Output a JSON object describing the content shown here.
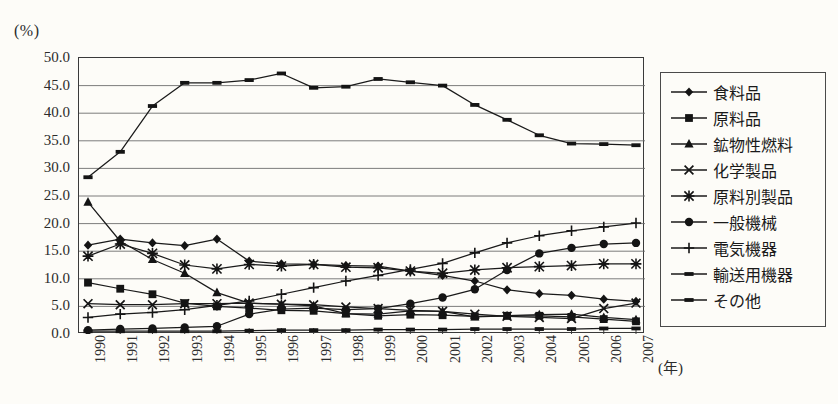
{
  "chart_data": {
    "type": "line",
    "title": "",
    "xlabel": "(年)",
    "ylabel": "(%)",
    "unit_label": "(%)",
    "x_unit_label": "(年)",
    "grid": true,
    "legend_position": "right",
    "ylim": [
      0.0,
      50.0
    ],
    "ytick_step": 5.0,
    "yticks": [
      "0.0",
      "5.0",
      "10.0",
      "15.0",
      "20.0",
      "25.0",
      "30.0",
      "35.0",
      "40.0",
      "45.0",
      "50.0"
    ],
    "categories": [
      "1990",
      "1991",
      "1992",
      "1993",
      "1994",
      "1995",
      "1996",
      "1997",
      "1998",
      "1999",
      "2000",
      "2001",
      "2002",
      "2003",
      "2004",
      "2005",
      "2006",
      "2007"
    ],
    "series": [
      {
        "name": "食料品",
        "marker": "diamond",
        "values": [
          16.1,
          17.2,
          16.5,
          16.0,
          17.2,
          13.2,
          12.7,
          12.6,
          12.4,
          12.3,
          11.4,
          10.6,
          9.6,
          8.0,
          7.3,
          7.0,
          6.3,
          5.9
        ]
      },
      {
        "name": "原料品",
        "marker": "square",
        "values": [
          9.3,
          8.2,
          7.2,
          5.6,
          5.0,
          4.7,
          4.3,
          4.2,
          3.7,
          3.3,
          3.5,
          3.4,
          3.2,
          3.3,
          3.3,
          3.1,
          2.7,
          2.3
        ]
      },
      {
        "name": "鉱物性燃料",
        "marker": "triangle",
        "values": [
          23.9,
          16.8,
          13.5,
          11.0,
          7.5,
          5.6,
          5.4,
          5.1,
          3.7,
          3.6,
          4.2,
          4.1,
          3.1,
          3.3,
          3.5,
          3.6,
          3.0,
          2.6
        ]
      },
      {
        "name": "化学製品",
        "marker": "cross-x",
        "values": [
          5.5,
          5.3,
          5.3,
          5.5,
          5.5,
          5.6,
          5.4,
          5.3,
          4.9,
          4.6,
          4.3,
          4.1,
          3.6,
          3.2,
          3.0,
          2.8,
          4.6,
          5.6
        ]
      },
      {
        "name": "原料別製品",
        "marker": "asterisk",
        "values": [
          14.1,
          16.3,
          14.6,
          12.5,
          11.8,
          12.6,
          12.3,
          12.6,
          12.1,
          12.0,
          11.4,
          11.0,
          11.6,
          12.0,
          12.2,
          12.4,
          12.7,
          12.7
        ]
      },
      {
        "name": "一般機械",
        "marker": "circle",
        "values": [
          0.7,
          0.9,
          1.0,
          1.2,
          1.4,
          3.6,
          4.5,
          4.7,
          4.4,
          4.6,
          5.5,
          6.6,
          8.1,
          11.6,
          14.6,
          15.6,
          16.3,
          16.5
        ]
      },
      {
        "name": "電気機器",
        "marker": "plus",
        "values": [
          3.0,
          3.6,
          3.9,
          4.4,
          5.2,
          6.0,
          7.2,
          8.4,
          9.6,
          10.6,
          11.7,
          12.8,
          14.7,
          16.5,
          17.8,
          18.7,
          19.4,
          20.1
        ]
      },
      {
        "name": "輸送用機器",
        "marker": "dash",
        "values": [
          0.5,
          0.5,
          0.5,
          0.5,
          0.5,
          0.6,
          0.7,
          0.7,
          0.7,
          0.8,
          0.8,
          0.8,
          0.9,
          0.9,
          0.9,
          0.9,
          1.0,
          1.0
        ]
      },
      {
        "name": "その他",
        "marker": "dash",
        "values": [
          28.4,
          33.0,
          41.3,
          45.5,
          45.5,
          46.0,
          47.2,
          44.6,
          44.8,
          46.2,
          45.6,
          45.0,
          41.5,
          38.8,
          36.0,
          34.5,
          34.4,
          34.2
        ]
      }
    ]
  }
}
